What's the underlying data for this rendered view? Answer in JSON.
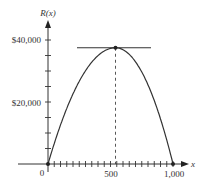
{
  "chart_data": {
    "type": "line",
    "title": "",
    "xlabel": "x",
    "ylabel": "R(x)",
    "function": "R(x), concave-down parabola (revenue), zero at x=0 and x=1,000",
    "x_ticks": [
      0,
      500,
      1000
    ],
    "x_tick_labels": [
      "0",
      "500",
      "1,000"
    ],
    "x_minor_tick_step": 50,
    "y_ticks": [
      20000,
      40000
    ],
    "y_tick_labels": [
      "$20,000",
      "$40,000"
    ],
    "y_minor_tick_step": 5000,
    "xlim": [
      0,
      1050
    ],
    "ylim": [
      0,
      42000
    ],
    "x": [
      0,
      100,
      200,
      300,
      400,
      540,
      700,
      800,
      900,
      1000
    ],
    "series": [
      {
        "name": "R(x)",
        "values": [
          0,
          12000,
          22000,
          30000,
          35000,
          37500,
          32000,
          24000,
          13000,
          0
        ]
      }
    ],
    "annotations": [
      {
        "type": "horizontal-tangent-line",
        "at_x": 540,
        "y": 37500,
        "label": ""
      },
      {
        "type": "dashed-vertical-line",
        "x": 540,
        "from_y": 0,
        "to_y": 37500
      },
      {
        "type": "point",
        "x": 540,
        "y": 37500
      },
      {
        "type": "point",
        "x": 0,
        "y": 0
      },
      {
        "type": "point",
        "x": 1000,
        "y": 0
      }
    ],
    "grid": false,
    "legend": null
  },
  "axes": {
    "y_label": "R(x)",
    "x_label": "x",
    "origin_label": "0",
    "y_tick_labels": [
      "$40,000",
      "$20,000"
    ],
    "x_tick_labels": [
      "500",
      "1,000"
    ]
  }
}
